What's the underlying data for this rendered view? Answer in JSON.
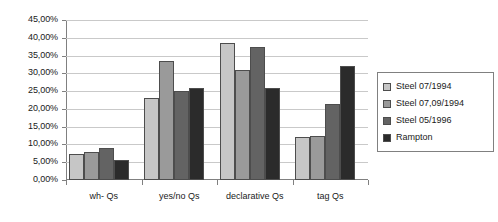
{
  "chart_data": {
    "type": "bar",
    "title": "",
    "xlabel": "",
    "ylabel": "",
    "grid": true,
    "legend_position": "right",
    "ylim": [
      0,
      45
    ],
    "categories": [
      "wh- Qs",
      "yes/no Qs",
      "declarative Qs",
      "tag Qs"
    ],
    "ytick_labels": [
      "0,00%",
      "5,00%",
      "10,00%",
      "15,00%",
      "20,00%",
      "25,00%",
      "30,00%",
      "35,00%",
      "40,00%",
      "45,00%"
    ],
    "ytick_values": [
      0,
      5,
      10,
      15,
      20,
      25,
      30,
      35,
      40,
      45
    ],
    "series": [
      {
        "name": "Steel 07/1994",
        "color": "#c6c6c6",
        "values": [
          7.3,
          23.0,
          38.5,
          12.0
        ]
      },
      {
        "name": "Steel 07,09/1994",
        "color": "#9a9a9a",
        "values": [
          8.0,
          33.5,
          31.0,
          12.5
        ]
      },
      {
        "name": "Steel 05/1996",
        "color": "#636363",
        "values": [
          9.0,
          25.0,
          37.3,
          21.5
        ]
      },
      {
        "name": "Rampton",
        "color": "#2b2b2b",
        "values": [
          5.5,
          26.0,
          26.0,
          32.0
        ]
      }
    ]
  }
}
